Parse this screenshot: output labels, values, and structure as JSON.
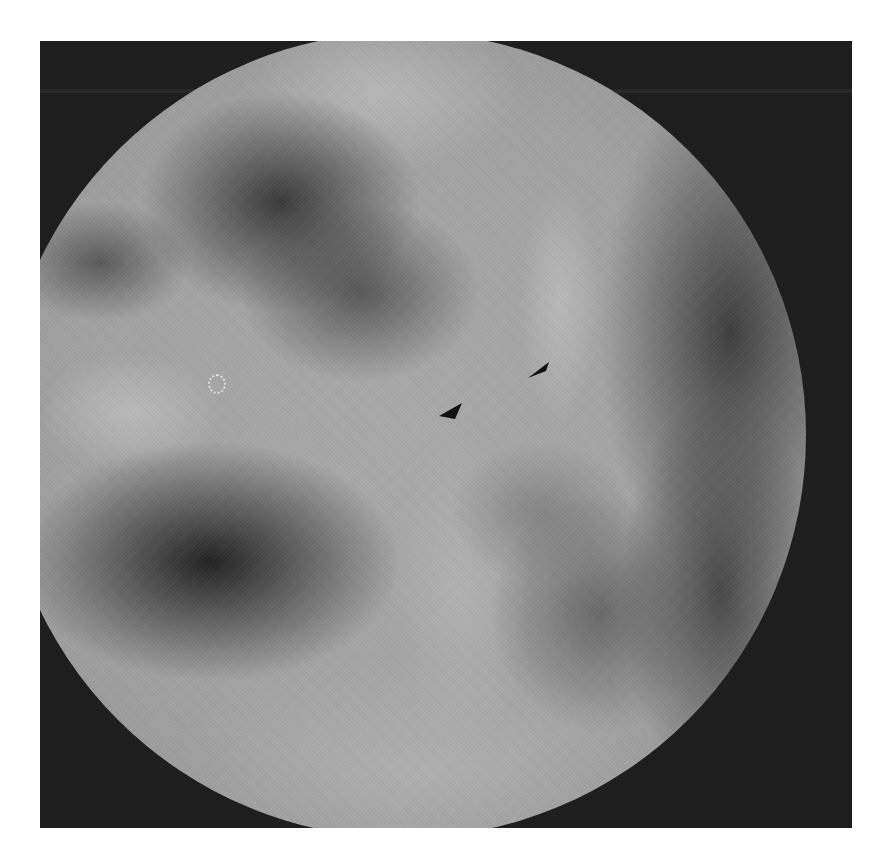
{
  "image": {
    "description": "Grayscale endoscopic photograph with circular field of view inside a dark square frame",
    "colors": {
      "page_background": "#ffffff",
      "frame": "#1e1e1e",
      "tissue_base": "#a9a9a9",
      "dark_recess": "#1c1c1c",
      "arrowhead": "#111111"
    },
    "annotations": [
      {
        "type": "arrowhead",
        "name": "upper-right-arrowhead",
        "tip": [
          528,
          378
        ],
        "direction": "down-left"
      },
      {
        "type": "arrowhead",
        "name": "lower-left-arrowhead",
        "tip": [
          440,
          416
        ],
        "direction": "down-left"
      }
    ]
  }
}
